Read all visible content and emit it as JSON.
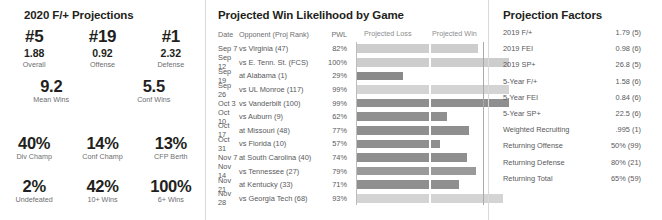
{
  "left_panel": {
    "title": "2020 F/+ Projections",
    "rank_row": [
      {
        "rank": "#5",
        "value": "1.88",
        "label": "Overall"
      },
      {
        "rank": "#19",
        "value": "0.92",
        "label": "Offense"
      },
      {
        "rank": "#1",
        "value": "2.32",
        "label": "Defense"
      }
    ],
    "wins_row": [
      {
        "value": "9.2",
        "label": "Mean Wins"
      },
      {
        "value": "5.5",
        "label": "Conf Wins"
      }
    ],
    "pct_row_1": [
      {
        "value": "40%",
        "label": "Div Champ"
      },
      {
        "value": "14%",
        "label": "Conf Champ"
      },
      {
        "value": "13%",
        "label": "CFP Berth"
      }
    ],
    "pct_row_2": [
      {
        "value": "2%",
        "label": "Undefeated"
      },
      {
        "value": "42%",
        "label": "10+ Wins"
      },
      {
        "value": "100%",
        "label": "6+ Wins"
      }
    ]
  },
  "middle_panel": {
    "title": "Projected Win Likelihood by Game",
    "headers": {
      "date": "Date",
      "opponent": "Opponent (Proj Rank)",
      "pwl": "PWL",
      "projected_loss": "Projected Loss",
      "projected_win": "Projected Win"
    },
    "games": [
      {
        "date": "Sep 7",
        "opponent": "vs Virginia (47)",
        "pwl": "82%",
        "pwl_value": 82,
        "loss_width": 72,
        "win_width": 47,
        "shade": "#cdcdcd"
      },
      {
        "date": "Sep 12",
        "opponent": "vs E. Tenn. St. (FCS)",
        "pwl": "100%",
        "pwl_value": 100,
        "loss_width": 72,
        "win_width": 78,
        "shade": "#cdcdcd"
      },
      {
        "date": "Sep 19",
        "opponent": "at Alabama (1)",
        "pwl": "29%",
        "pwl_value": 29,
        "loss_width": 46,
        "win_width": 0,
        "shade": "#8a8a8a"
      },
      {
        "date": "Sep 26",
        "opponent": "vs UL Monroe (117)",
        "pwl": "99%",
        "pwl_value": 99,
        "loss_width": 72,
        "win_width": 78,
        "shade": "#d4d4d4"
      },
      {
        "date": "Oct 3",
        "opponent": "vs Vanderbilt (100)",
        "pwl": "99%",
        "pwl_value": 99,
        "loss_width": 72,
        "win_width": 78,
        "shade": "#8f8f8f"
      },
      {
        "date": "Oct 10",
        "opponent": "vs Auburn (9)",
        "pwl": "62%",
        "pwl_value": 62,
        "loss_width": 72,
        "win_width": 16,
        "shade": "#8f8f8f"
      },
      {
        "date": "Oct 17",
        "opponent": "at Missouri (48)",
        "pwl": "77%",
        "pwl_value": 77,
        "loss_width": 72,
        "win_width": 38,
        "shade": "#8f8f8f"
      },
      {
        "date": "Oct 31",
        "opponent": "vs Florida (10)",
        "pwl": "57%",
        "pwl_value": 57,
        "loss_width": 72,
        "win_width": 9,
        "shade": "#8f8f8f"
      },
      {
        "date": "Nov 7",
        "opponent": "at South Carolina (40)",
        "pwl": "74%",
        "pwl_value": 74,
        "loss_width": 72,
        "win_width": 36,
        "shade": "#8f8f8f"
      },
      {
        "date": "Nov 14",
        "opponent": "vs Tennessee (27)",
        "pwl": "79%",
        "pwl_value": 79,
        "loss_width": 72,
        "win_width": 45,
        "shade": "#9a9a9a"
      },
      {
        "date": "Nov 21",
        "opponent": "at Kentucky (33)",
        "pwl": "71%",
        "pwl_value": 71,
        "loss_width": 72,
        "win_width": 28,
        "shade": "#8f8f8f"
      },
      {
        "date": "Nov 28",
        "opponent": "vs Georgia Tech (68)",
        "pwl": "93%",
        "pwl_value": 93,
        "loss_width": 72,
        "win_width": 72,
        "shade": "#d4d4d4"
      }
    ]
  },
  "right_panel": {
    "title": "Projection Factors",
    "factors": [
      {
        "label": "2019 F/+",
        "value": "1.79 (5)"
      },
      {
        "label": "2019 FEI",
        "value": "0.98 (6)"
      },
      {
        "label": "2019 SP+",
        "value": "26.8 (5)"
      },
      {
        "label": "5-Year F/+",
        "value": "1.58 (6)"
      },
      {
        "label": "5-Year FEI",
        "value": "0.84 (6)"
      },
      {
        "label": "5-Year SP+",
        "value": "22.5 (6)"
      },
      {
        "label": "Weighted Recruiting",
        "value": ".995 (1)"
      },
      {
        "label": "Returning Offense",
        "value": "50% (99)"
      },
      {
        "label": "Returning Defense",
        "value": "80% (21)"
      },
      {
        "label": "Returning Total",
        "value": "65% (59)"
      }
    ]
  },
  "chart_data": {
    "type": "bar",
    "title": "Projected Win Likelihood by Game",
    "xlabel": "",
    "ylabel": "",
    "categories": [
      "Sep 7 vs Virginia (47)",
      "Sep 12 vs E. Tenn. St. (FCS)",
      "Sep 19 at Alabama (1)",
      "Sep 26 vs UL Monroe (117)",
      "Oct 3 vs Vanderbilt (100)",
      "Oct 10 vs Auburn (9)",
      "Oct 17 at Missouri (48)",
      "Oct 31 vs Florida (10)",
      "Nov 7 at South Carolina (40)",
      "Nov 14 vs Tennessee (27)",
      "Nov 21 at Kentucky (33)",
      "Nov 28 vs Georgia Tech (68)"
    ],
    "values": [
      82,
      100,
      29,
      99,
      99,
      62,
      77,
      57,
      74,
      79,
      71,
      93
    ],
    "ylim": [
      0,
      100
    ],
    "grid": false,
    "legend": [
      "Projected Loss",
      "Projected Win"
    ],
    "legend_position": "top"
  }
}
